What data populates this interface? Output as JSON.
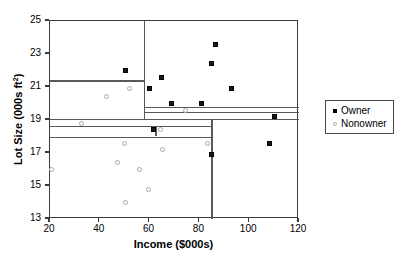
{
  "chart_data": {
    "type": "scatter",
    "title": "",
    "xlabel": "Income ($000s)",
    "ylabel": "Lot Size (000s ft²)",
    "xlim": [
      20,
      120
    ],
    "ylim": [
      13,
      25
    ],
    "xticks": [
      20,
      40,
      60,
      80,
      100,
      120
    ],
    "yticks": [
      13,
      15,
      17,
      19,
      21,
      23,
      25
    ],
    "grid": false,
    "legend_position": "right",
    "series": [
      {
        "name": "Owner",
        "marker": "filled-square",
        "color": "#1a1a1a",
        "points": [
          [
            50.5,
            22.0
          ],
          [
            60.0,
            20.9
          ],
          [
            64.8,
            21.6
          ],
          [
            68.6,
            20.0
          ],
          [
            81.0,
            20.0
          ],
          [
            84.8,
            22.4
          ],
          [
            86.5,
            23.6
          ],
          [
            93.0,
            20.9
          ],
          [
            110.0,
            19.2
          ],
          [
            108.0,
            17.6
          ],
          [
            85.0,
            16.9
          ],
          [
            61.5,
            18.4
          ]
        ]
      },
      {
        "name": "Nonowner",
        "marker": "open-circle",
        "color": "#a8a8a8",
        "points": [
          [
            42.8,
            20.4
          ],
          [
            52.0,
            20.9
          ],
          [
            74.5,
            19.6
          ],
          [
            32.8,
            18.8
          ],
          [
            64.5,
            18.4
          ],
          [
            83.2,
            17.6
          ],
          [
            49.8,
            17.6
          ],
          [
            65.0,
            17.2
          ],
          [
            47.0,
            16.4
          ],
          [
            20.5,
            16.0
          ],
          [
            56.0,
            16.0
          ],
          [
            59.5,
            14.8
          ],
          [
            50.5,
            14.0
          ]
        ]
      }
    ],
    "partitions": [
      {
        "orientation": "horizontal",
        "value": 21.4,
        "x_from": 20,
        "x_to": 57.8
      },
      {
        "orientation": "horizontal",
        "value": 19.8,
        "x_from": 57.8,
        "x_to": 120
      },
      {
        "orientation": "horizontal",
        "value": 19.5,
        "x_from": 57.8,
        "x_to": 120
      },
      {
        "orientation": "horizontal",
        "value": 19.05,
        "x_from": 20,
        "x_to": 120
      },
      {
        "orientation": "horizontal",
        "value": 18.65,
        "x_from": 20,
        "x_to": 84.8
      },
      {
        "orientation": "horizontal",
        "value": 18.0,
        "x_from": 20,
        "x_to": 84.8
      },
      {
        "orientation": "vertical",
        "value": 57.8,
        "y_from": 19.05,
        "y_to": 25
      },
      {
        "orientation": "vertical",
        "value": 84.8,
        "y_from": 13,
        "y_to": 19.05
      },
      {
        "orientation": "vertical",
        "value": 62.3,
        "y_from": 18.0,
        "y_to": 18.65
      }
    ]
  },
  "legend": {
    "items": [
      {
        "label": "Owner",
        "marker": "filled-square"
      },
      {
        "label": "Nonowner",
        "marker": "open-circle"
      }
    ]
  }
}
